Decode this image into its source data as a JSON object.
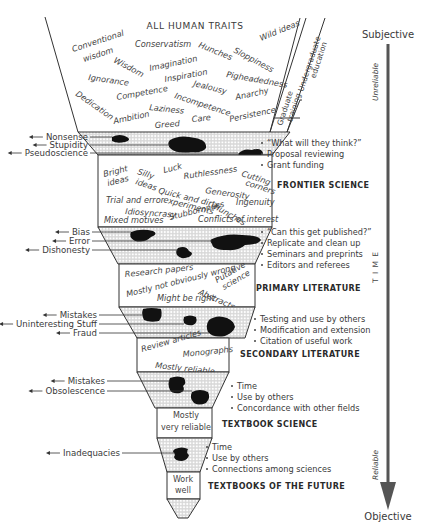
{
  "title": "ALL HUMAN TRAITS",
  "traits": [
    {
      "text": "Conventional",
      "x": 73,
      "y": 52,
      "r": -18
    },
    {
      "text": "wisdom",
      "x": 84,
      "y": 62,
      "r": -18
    },
    {
      "text": "Wisdom",
      "x": 113,
      "y": 62,
      "r": 28
    },
    {
      "text": "Conservatism",
      "x": 135,
      "y": 47,
      "r": 0
    },
    {
      "text": "Imagination",
      "x": 150,
      "y": 71,
      "r": -12
    },
    {
      "text": "Hunches",
      "x": 198,
      "y": 47,
      "r": 22
    },
    {
      "text": "Sloppiness",
      "x": 233,
      "y": 52,
      "r": 28
    },
    {
      "text": "Wild ideas",
      "x": 261,
      "y": 41,
      "r": -22
    },
    {
      "text": "Ignorance",
      "x": 88,
      "y": 80,
      "r": 8
    },
    {
      "text": "Inspiration",
      "x": 165,
      "y": 82,
      "r": -10
    },
    {
      "text": "Jealousy",
      "x": 193,
      "y": 86,
      "r": 14
    },
    {
      "text": "Pigheadedness",
      "x": 226,
      "y": 77,
      "r": 10
    },
    {
      "text": "Dedication",
      "x": 75,
      "y": 95,
      "r": 35
    },
    {
      "text": "Competence",
      "x": 117,
      "y": 100,
      "r": -10
    },
    {
      "text": "Incompetence",
      "x": 174,
      "y": 98,
      "r": 18
    },
    {
      "text": "Anarchy",
      "x": 236,
      "y": 100,
      "r": -12
    },
    {
      "text": "Laziness",
      "x": 149,
      "y": 110,
      "r": 6
    },
    {
      "text": "Ambition",
      "x": 114,
      "y": 124,
      "r": -12
    },
    {
      "text": "Greed",
      "x": 155,
      "y": 128,
      "r": -4
    },
    {
      "text": "Care",
      "x": 192,
      "y": 122,
      "r": -6
    },
    {
      "text": "Persistence",
      "x": 230,
      "y": 122,
      "r": -12
    }
  ],
  "education": {
    "undergraduate": [
      "Undergraduate",
      "education"
    ],
    "graduate": [
      "Graduate",
      "training"
    ]
  },
  "axis": {
    "top_label": "Subjective",
    "bottom_label": "Objective",
    "time_label": "T I M E",
    "unreliable_label": "Unreliable",
    "reliable_label": "Reliable"
  },
  "filters": [
    {
      "id": "filter-1",
      "rejects": [
        "Nonsense",
        "Stupidity",
        "Pseudoscience"
      ],
      "criteria": [
        "“What will they think?”",
        "Proposal reviewing",
        "Grant funding"
      ]
    },
    {
      "id": "filter-2",
      "rejects": [
        "Bias",
        "Error",
        "Dishonesty"
      ],
      "criteria": [
        "“Can this get published?”",
        "Replicate and clean up",
        "Seminars and preprints",
        "Editors and referees"
      ]
    },
    {
      "id": "filter-3",
      "rejects": [
        "Mistakes",
        "Uninteresting Stuff",
        "Fraud"
      ],
      "criteria": [
        "Testing and use by others",
        "Modification and extension",
        "Citation of useful work"
      ]
    },
    {
      "id": "filter-4",
      "rejects": [
        "Mistakes",
        "Obsolescence"
      ],
      "criteria": [
        "Time",
        "Use by others",
        "Concordance with other fields"
      ]
    },
    {
      "id": "filter-5",
      "rejects": [
        "Inadequacies"
      ],
      "criteria": [
        "Time",
        "Use by others",
        "Connections among sciences"
      ]
    }
  ],
  "stages": [
    {
      "heading": "FRONTIER SCIENCE",
      "words": [
        {
          "text": "Bright",
          "x": 104,
          "y": 177,
          "r": -14
        },
        {
          "text": "ideas",
          "x": 108,
          "y": 186,
          "r": -14
        },
        {
          "text": "Silly",
          "x": 137,
          "y": 174,
          "r": 18
        },
        {
          "text": "ideas",
          "x": 135,
          "y": 184,
          "r": 18
        },
        {
          "text": "Luck",
          "x": 164,
          "y": 173,
          "r": -14
        },
        {
          "text": "Ruthlessness",
          "x": 184,
          "y": 179,
          "r": -8
        },
        {
          "text": "Cutting",
          "x": 241,
          "y": 176,
          "r": 18
        },
        {
          "text": "corners",
          "x": 245,
          "y": 185,
          "r": 18
        },
        {
          "text": "Quick and dirty",
          "x": 158,
          "y": 193,
          "r": 14
        },
        {
          "text": "experiments",
          "x": 163,
          "y": 202,
          "r": 14
        },
        {
          "text": "Generosity",
          "x": 205,
          "y": 193,
          "r": 8
        },
        {
          "text": "Trial and error",
          "x": 106,
          "y": 203,
          "r": 0
        },
        {
          "text": "Hunches",
          "x": 213,
          "y": 208,
          "r": 30
        },
        {
          "text": "Ingenuity",
          "x": 236,
          "y": 205,
          "r": 0
        },
        {
          "text": "Idiosyncrasy",
          "x": 125,
          "y": 214,
          "r": 4
        },
        {
          "text": "Stubbornness",
          "x": 170,
          "y": 220,
          "r": -14
        },
        {
          "text": "Mixed motives",
          "x": 104,
          "y": 223,
          "r": 0
        },
        {
          "text": "Conflicts of interest",
          "x": 198,
          "y": 222,
          "r": 0
        }
      ]
    },
    {
      "heading": "PRIMARY LITERATURE",
      "words": [
        {
          "text": "Research papers",
          "x": 125,
          "y": 277,
          "r": -6
        },
        {
          "text": "Mostly not obviously wrong",
          "x": 127,
          "y": 297,
          "r": -14
        },
        {
          "text": "Putative",
          "x": 217,
          "y": 283,
          "r": -30
        },
        {
          "text": "science",
          "x": 224,
          "y": 290,
          "r": -30
        },
        {
          "text": "Abstracts",
          "x": 198,
          "y": 294,
          "r": 24
        },
        {
          "text": "Might be right",
          "x": 157,
          "y": 301,
          "r": 0
        }
      ]
    },
    {
      "heading": "SECONDARY LITERATURE",
      "words": [
        {
          "text": "Review articles",
          "x": 142,
          "y": 352,
          "r": -16
        },
        {
          "text": "Monographs",
          "x": 183,
          "y": 357,
          "r": -6
        },
        {
          "text": "Mostly reliable",
          "x": 155,
          "y": 368,
          "r": 6
        }
      ]
    },
    {
      "heading": "TEXTBOOK SCIENCE",
      "words": [
        {
          "text": "Mostly",
          "x": 186,
          "y": 418,
          "r": 0
        },
        {
          "text": "very reliable",
          "x": 186,
          "y": 430,
          "r": 0
        }
      ]
    },
    {
      "heading": "TEXTBOOKS OF THE FUTURE",
      "words": [
        {
          "text": "Work",
          "x": 183,
          "y": 482,
          "r": 0
        },
        {
          "text": "well",
          "x": 183,
          "y": 493,
          "r": 0
        }
      ]
    }
  ],
  "caption": "Figure 1. Fra..."
}
